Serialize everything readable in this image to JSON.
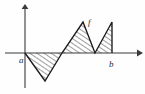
{
  "figure": {
    "caption": "",
    "background_color": "#fefefe",
    "axis_color": "#3a3a3a",
    "curve_color": "#1a1a1a",
    "hatch_color": "#1a1a1a",
    "labels": {
      "function": "f",
      "left_endpoint": "a",
      "right_endpoint": "b"
    },
    "label_positions": {
      "function": {
        "x": 88,
        "y": 25
      },
      "left_endpoint": {
        "x": 19,
        "y": 63
      },
      "right_endpoint": {
        "x": 111,
        "y": 67
      }
    }
  },
  "chart_data": {
    "type": "line",
    "title": "",
    "xlabel": "",
    "ylabel": "",
    "grid": false,
    "legend": "none",
    "axes": {
      "origin_px": {
        "x": 25,
        "y": 53
      },
      "x_axis_px": {
        "x1": 5,
        "y1": 53,
        "x2": 140,
        "y2": 53
      },
      "y_axis_px": {
        "x1": 25,
        "y1": 88,
        "x2": 25,
        "y2": 6
      },
      "x_arrow": "right",
      "y_arrow": "up"
    },
    "series": [
      {
        "name": "f",
        "points_px": [
          {
            "x": 25,
            "y": 53
          },
          {
            "x": 45,
            "y": 81
          },
          {
            "x": 62,
            "y": 53
          },
          {
            "x": 83,
            "y": 22
          },
          {
            "x": 95,
            "y": 53
          },
          {
            "x": 112,
            "y": 22
          },
          {
            "x": 112,
            "y": 53
          }
        ]
      }
    ],
    "regions": [
      {
        "name": "negative-lobe",
        "sign": "negative",
        "hatched": true,
        "vertices_px": [
          {
            "x": 25,
            "y": 53
          },
          {
            "x": 45,
            "y": 81
          },
          {
            "x": 62,
            "y": 53
          }
        ]
      },
      {
        "name": "positive-lobe-1",
        "sign": "positive",
        "hatched": true,
        "vertices_px": [
          {
            "x": 62,
            "y": 53
          },
          {
            "x": 83,
            "y": 22
          },
          {
            "x": 95,
            "y": 53
          }
        ]
      },
      {
        "name": "positive-lobe-2",
        "sign": "positive",
        "hatched": true,
        "vertices_px": [
          {
            "x": 95,
            "y": 53
          },
          {
            "x": 112,
            "y": 22
          },
          {
            "x": 112,
            "y": 53
          }
        ]
      }
    ]
  }
}
